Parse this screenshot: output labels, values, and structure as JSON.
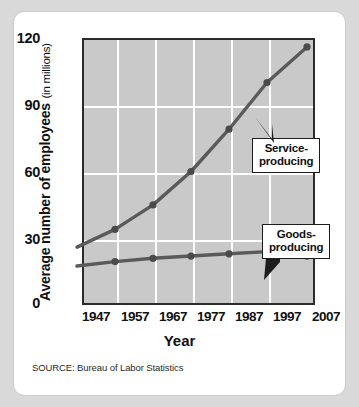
{
  "axes": {
    "y_title_strong": "Average number of employees",
    "y_title_light": "(in millions)",
    "x_title": "Year",
    "y_ticks": [
      "120",
      "90",
      "60",
      "30",
      "0"
    ],
    "x_ticks": [
      "1947",
      "1957",
      "1967",
      "1977",
      "1987",
      "1997",
      "2007"
    ]
  },
  "annotations": {
    "service": {
      "line1": "Service-",
      "line2": "producing"
    },
    "goods": {
      "line1": "Goods-",
      "line2": "producing"
    }
  },
  "source": "SOURCE: Bureau of Labor Statistics",
  "colors": {
    "plot_background": "#c9c9c9",
    "gridline": "#ffffff",
    "axis_frame": "#2b2b2b",
    "series_line": "#5a5a5a",
    "card_background": "#ffffff",
    "page_background": "#d9d9d9"
  },
  "chart_data": {
    "type": "line",
    "title": "",
    "subtitle": "",
    "xlabel": "Year",
    "ylabel": "Average number of employees (in millions)",
    "x": [
      1947,
      1957,
      1967,
      1977,
      1987,
      1997,
      2007
    ],
    "xlim": [
      1942,
      2010
    ],
    "ylim": [
      0,
      120
    ],
    "yticks": [
      0,
      30,
      60,
      90,
      120
    ],
    "xticks": [
      1947,
      1957,
      1967,
      1977,
      1987,
      1997,
      2007
    ],
    "grid": true,
    "legend": "annotated-callouts",
    "markers": true,
    "series": [
      {
        "name": "Service-producing",
        "values": [
          26,
          34,
          45,
          60,
          79,
          100,
          116
        ]
      },
      {
        "name": "Goods-producing",
        "values": [
          17.5,
          19.5,
          21,
          22,
          23,
          24,
          22
        ]
      }
    ],
    "annotations": [
      {
        "text": "Service-producing",
        "points_to_series": "Service-producing"
      },
      {
        "text": "Goods-producing",
        "points_to_series": "Goods-producing"
      }
    ],
    "source": "SOURCE: Bureau of Labor Statistics"
  }
}
